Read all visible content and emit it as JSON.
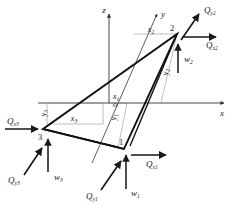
{
  "figure": {
    "stroke_color": "#1a1a1a",
    "thin_color": "#777777",
    "background": "#ffffff"
  },
  "axes": [
    {
      "name": "z-axis",
      "label": "z",
      "direction": "up"
    },
    {
      "name": "y-axis",
      "label": "y",
      "direction": "up-right"
    },
    {
      "name": "x-axis",
      "label": "x",
      "direction": "right"
    }
  ],
  "origin": {
    "label": "o"
  },
  "nodes": [
    {
      "id": "node-1",
      "label": "1"
    },
    {
      "id": "node-2",
      "label": "2"
    },
    {
      "id": "node-3",
      "label": "3"
    }
  ],
  "dimensions": [
    {
      "name": "x1",
      "base": "x",
      "sub": "1"
    },
    {
      "name": "x2",
      "base": "x",
      "sub": "2"
    },
    {
      "name": "x3",
      "base": "x",
      "sub": "3"
    },
    {
      "name": "y1",
      "base": "y",
      "sub": "1"
    },
    {
      "name": "y2",
      "base": "y",
      "sub": "2"
    },
    {
      "name": "y3",
      "base": "y",
      "sub": "3"
    }
  ],
  "forces": [
    {
      "name": "Qx1",
      "base": "Q",
      "sub": "x1",
      "node": "1",
      "direction": "right"
    },
    {
      "name": "Qy1",
      "base": "Q",
      "sub": "y1",
      "node": "1",
      "direction": "up-right"
    },
    {
      "name": "w1",
      "base": "w",
      "sub": "1",
      "node": "1",
      "direction": "up"
    },
    {
      "name": "Qx2",
      "base": "Q",
      "sub": "x2",
      "node": "2",
      "direction": "right"
    },
    {
      "name": "Qy2",
      "base": "Q",
      "sub": "y2",
      "node": "2",
      "direction": "up-right"
    },
    {
      "name": "w2",
      "base": "w",
      "sub": "2",
      "node": "2",
      "direction": "up"
    },
    {
      "name": "Qx3",
      "base": "Q",
      "sub": "x3",
      "node": "3",
      "direction": "right"
    },
    {
      "name": "Qy3",
      "base": "Q",
      "sub": "y3",
      "node": "3",
      "direction": "up-right"
    },
    {
      "name": "w3",
      "base": "w",
      "sub": "3",
      "node": "3",
      "direction": "up"
    }
  ]
}
